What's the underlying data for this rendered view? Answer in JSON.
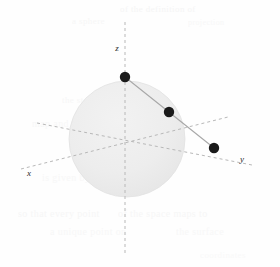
{
  "figure": {
    "width": 280,
    "height": 267,
    "background_color": "#fefefe"
  },
  "colors": {
    "sphere_fill": "#ececec",
    "sphere_edge": "#e2e2e2",
    "axis_line": "#b8b8b8",
    "secant_line": "#a8a8a8",
    "point_fill": "#1a1a1a",
    "label_text": "#2a2a2a",
    "ghost_text": "#f2f2f2"
  },
  "sphere": {
    "name": "unit-sphere",
    "center_x": 127,
    "center_y": 139,
    "radius": 58
  },
  "axes": [
    {
      "id": "z",
      "label": "z",
      "label_x": 117,
      "label_y": 51,
      "x1": 125,
      "y1": 22,
      "x2": 125,
      "y2": 256,
      "dash": "3,3"
    },
    {
      "id": "x",
      "label": "x",
      "label_x": 29,
      "label_y": 176,
      "x1": 21,
      "y1": 169,
      "x2": 228,
      "y2": 117,
      "dash": "3,3"
    },
    {
      "id": "y",
      "label": "y",
      "label_x": 242,
      "label_y": 162,
      "x1": 37,
      "y1": 123,
      "x2": 252,
      "y2": 165,
      "dash": "3,3"
    }
  ],
  "origin": {
    "label": "origin",
    "x": 125,
    "y": 139
  },
  "secant_line": {
    "name": "projection-line",
    "x1": 125,
    "y1": 77,
    "x2": 214,
    "y2": 148,
    "width": 1.1
  },
  "points": [
    {
      "id": "north-pole",
      "label": "",
      "x": 125,
      "y": 77,
      "r": 5.2
    },
    {
      "id": "sphere-point",
      "label": "",
      "x": 169,
      "y": 112,
      "r": 5.2
    },
    {
      "id": "plane-point",
      "label": "",
      "x": 214,
      "y": 148,
      "r": 5.2
    }
  ],
  "ghost_text": [
    {
      "text": "of the definition of",
      "x": 120,
      "y": 4,
      "size": 9,
      "opacity": 0.75
    },
    {
      "text": "a sphere",
      "x": 72,
      "y": 16,
      "size": 9,
      "opacity": 0.6
    },
    {
      "text": "projection",
      "x": 188,
      "y": 18,
      "size": 8,
      "opacity": 0.55
    },
    {
      "text": "the stereographic",
      "x": 62,
      "y": 95,
      "size": 9,
      "opacity": 0.6
    },
    {
      "text": "map and the plane",
      "x": 32,
      "y": 118,
      "size": 10,
      "opacity": 0.55
    },
    {
      "text": "onto the sphere",
      "x": 96,
      "y": 148,
      "size": 9,
      "opacity": 0.5
    },
    {
      "text": "is given by the",
      "x": 42,
      "y": 172,
      "size": 10,
      "opacity": 0.5
    },
    {
      "text": "so that every point",
      "x": 18,
      "y": 208,
      "size": 10,
      "opacity": 0.6
    },
    {
      "text": "of the space maps to",
      "x": 118,
      "y": 208,
      "size": 10,
      "opacity": 0.6
    },
    {
      "text": "a unique point on",
      "x": 50,
      "y": 226,
      "size": 10,
      "opacity": 0.55
    },
    {
      "text": "the surface",
      "x": 176,
      "y": 226,
      "size": 10,
      "opacity": 0.5
    },
    {
      "text": "coordinates",
      "x": 200,
      "y": 250,
      "size": 9,
      "opacity": 0.4
    }
  ]
}
